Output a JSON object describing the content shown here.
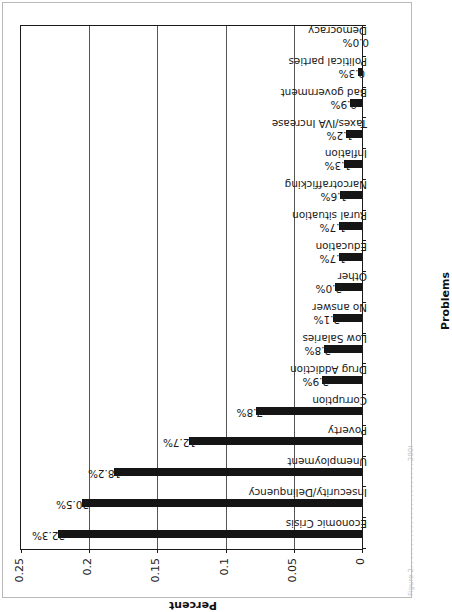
{
  "figure": {
    "x_axis_title": "Problems",
    "y_axis_title": "Percent",
    "caption_sliver": "Figure 2. . . . . . . . . . . . . . . . . . . . . . . . 2008-2009"
  },
  "chart_data": {
    "type": "bar",
    "orientation": "vertical",
    "title": "",
    "xlabel": "Problems",
    "ylabel": "Percent",
    "ylim": [
      0,
      0.25
    ],
    "ytick_labels": [
      "0",
      "0.05",
      "0.1",
      "0.15",
      "0.2",
      "0.25"
    ],
    "ytick_values": [
      0,
      0.05,
      0.1,
      0.15,
      0.2,
      0.25
    ],
    "grid": true,
    "grid_axis": "y",
    "legend": false,
    "bar_color": "#151515",
    "categories": [
      "Economic Crisis",
      "Insecurity/Delinquency",
      "Unemployment",
      "Poverty",
      "Corruption",
      "Drug Addiction",
      "Low Salaries",
      "No answer",
      "Other",
      "Education",
      "Rural situation",
      "Narcotrafficking",
      "Inflation",
      "Taxes/IVA Increase",
      "Bad government",
      "Political parties",
      "Democracy"
    ],
    "values": [
      0.223,
      0.205,
      0.182,
      0.127,
      0.078,
      0.029,
      0.028,
      0.021,
      0.02,
      0.017,
      0.017,
      0.016,
      0.013,
      0.012,
      0.009,
      0.003,
      0.0
    ],
    "data_labels": [
      "22.3%",
      "20.5%",
      "18.2%",
      "12.7%",
      "7.8%",
      "2.9%",
      "2.8%",
      "2.1%",
      "2.0%",
      "1.7%",
      "1.7%",
      "1.6%",
      "1.3%",
      "1.2%",
      "0.9%",
      "0.3%",
      "0.0%"
    ]
  }
}
